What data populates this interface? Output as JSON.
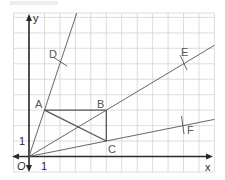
{
  "diagram": {
    "type": "coordinate-geometry",
    "grid_unit_px": 15.45,
    "origin_label": "O",
    "axes": {
      "x_label": "x",
      "y_label": "y",
      "x_tick_label": "1",
      "y_tick_label": "1"
    },
    "points": [
      {
        "name": "A",
        "x": 1,
        "y": 3
      },
      {
        "name": "B",
        "x": 5,
        "y": 3
      },
      {
        "name": "C",
        "x": 5,
        "y": 1
      },
      {
        "name": "D",
        "x": 2,
        "y": 6
      },
      {
        "name": "E",
        "x": 10,
        "y": 6
      },
      {
        "name": "F",
        "x": 10,
        "y": 2
      }
    ],
    "rays": [
      {
        "from": "O",
        "through": [
          "A",
          "D"
        ]
      },
      {
        "from": "O",
        "through": [
          "B",
          "E"
        ]
      },
      {
        "from": "O",
        "through": [
          "C",
          "F"
        ]
      }
    ],
    "segments": [
      "AB",
      "BC",
      "AC"
    ],
    "colors": {
      "axis": "#2a2a2a",
      "lines": "#555555",
      "grid": "#d4d4d4"
    }
  }
}
